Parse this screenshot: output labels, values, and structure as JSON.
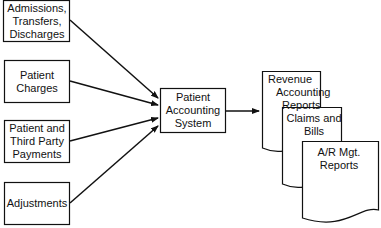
{
  "diagram": {
    "inputs": [
      {
        "lines": [
          "Admissions,",
          "Transfers,",
          "Discharges"
        ]
      },
      {
        "lines": [
          "Patient",
          "Charges"
        ]
      },
      {
        "lines": [
          "Patient and",
          "Third Party",
          "Payments"
        ]
      },
      {
        "lines": [
          "Adjustments"
        ]
      }
    ],
    "center": {
      "lines": [
        "Patient",
        "Accounting",
        "System"
      ]
    },
    "outputs": [
      {
        "lines": [
          "Revenue",
          "Accounting",
          "Reports"
        ]
      },
      {
        "lines": [
          "Claims and",
          "Bills"
        ]
      },
      {
        "lines": [
          "A/R Mgt.",
          "Reports"
        ]
      }
    ],
    "colors": {
      "line": "#111111",
      "background": "#ffffff"
    }
  }
}
